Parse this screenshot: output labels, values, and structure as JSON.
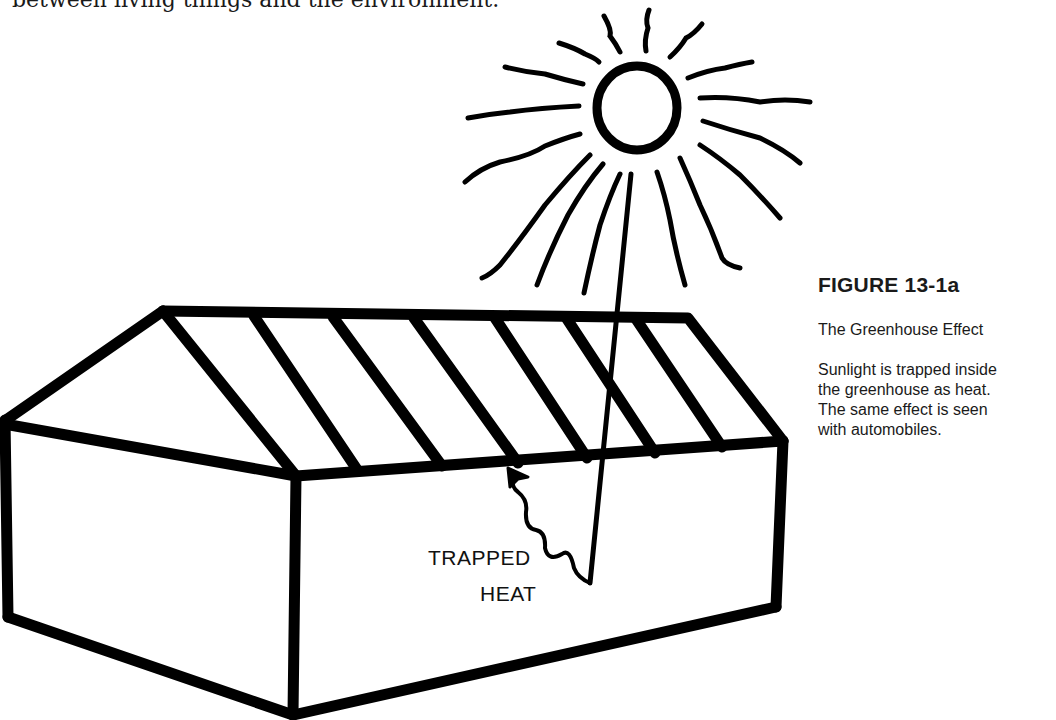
{
  "page": {
    "body_text_fragment": "between living things and the environment."
  },
  "figure": {
    "number": "FIGURE 13-1a",
    "title": "The Greenhouse Effect",
    "description": "Sunlight is trapped inside the greenhouse as heat. The same effect is seen with automobiles.",
    "illustration": {
      "subject": "greenhouse-with-sun",
      "label_line1": "TRAPPED",
      "label_line2": "HEAT",
      "stroke_color": "#000000",
      "background_color": "#ffffff"
    }
  }
}
